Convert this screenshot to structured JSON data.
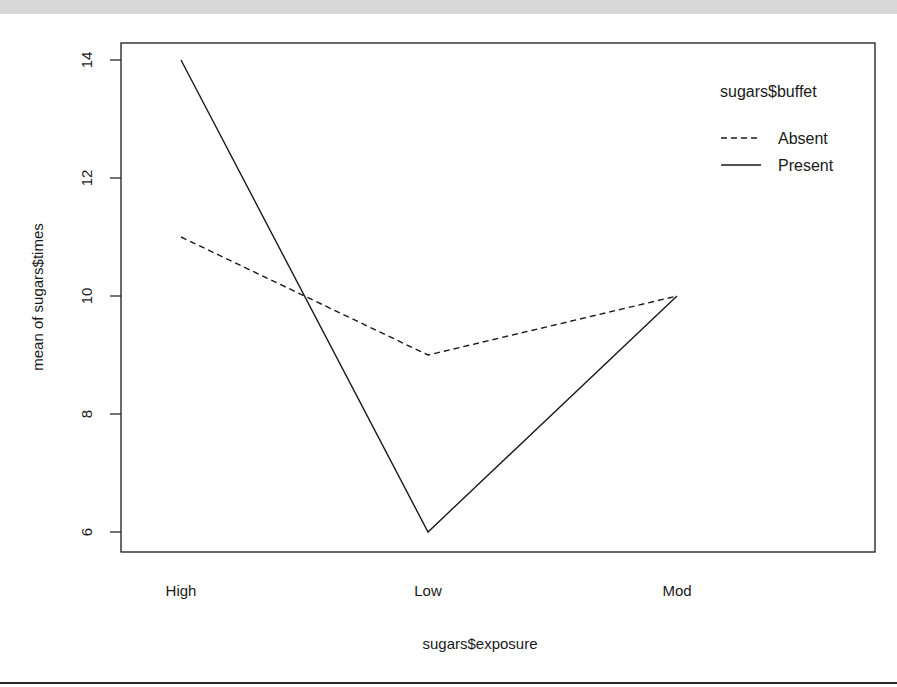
{
  "chart_data": {
    "type": "line",
    "title": "",
    "xlabel": "sugars$exposure",
    "ylabel": "mean of  sugars$times",
    "categories": [
      "High",
      "Low",
      "Mod"
    ],
    "series": [
      {
        "name": "Absent",
        "line_style": "dashed",
        "values": [
          11,
          9,
          10
        ]
      },
      {
        "name": "Present",
        "line_style": "solid",
        "values": [
          14,
          6,
          10
        ]
      }
    ],
    "yticks": [
      6,
      8,
      10,
      12,
      14
    ],
    "ylim": [
      5.66,
      14.29
    ],
    "grid": false,
    "legend": {
      "title": "sugars$buffet",
      "position": "top-right",
      "entries": [
        "Absent",
        "Present"
      ]
    },
    "line_color": "#1a1a1a"
  },
  "labels": {
    "x_axis": "sugars$exposure",
    "y_axis": "mean of  sugars$times",
    "x_ticks": [
      "High",
      "Low",
      "Mod"
    ],
    "y_ticks": [
      "6",
      "8",
      "10",
      "12",
      "14"
    ],
    "legend_title": "sugars$buffet",
    "legend_absent": "Absent",
    "legend_present": "Present"
  }
}
